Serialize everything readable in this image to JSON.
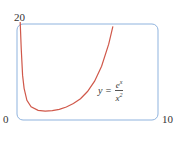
{
  "chart_data": {
    "type": "line",
    "title": "",
    "function": "y = e^x / x^2",
    "annotation": {
      "lhs": "y =",
      "numerator": "e",
      "numerator_exp": "x",
      "denominator": "x",
      "denominator_exp": "2"
    },
    "xlim": [
      0,
      10
    ],
    "ylim": [
      0,
      20
    ],
    "x_tick_labels": [
      "0",
      "10"
    ],
    "y_tick_labels": [
      "20"
    ],
    "origin_label": "0",
    "grid": false,
    "series": [
      {
        "name": "e^x/x^2",
        "color": "#d0584a",
        "x": [
          0.23,
          0.3,
          0.4,
          0.5,
          0.7,
          1.0,
          1.5,
          2.0,
          2.5,
          3.0,
          3.5,
          4.0,
          4.5,
          5.0,
          5.5,
          6.0,
          6.5,
          6.8
        ],
        "y": [
          23.7,
          15.0,
          9.3,
          6.6,
          4.1,
          2.72,
          1.99,
          1.85,
          1.95,
          2.23,
          2.7,
          3.41,
          4.44,
          5.94,
          8.09,
          11.2,
          15.8,
          19.5
        ]
      }
    ]
  },
  "colors": {
    "frame": "#8fb3de",
    "curve": "#d0584a"
  }
}
